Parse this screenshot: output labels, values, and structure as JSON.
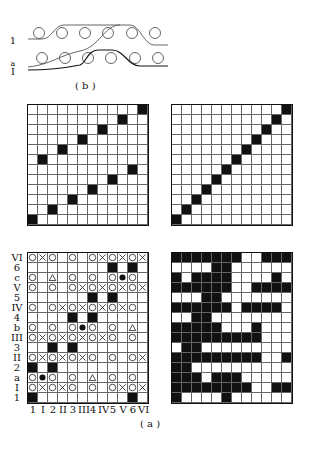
{
  "figure_b": {
    "caption": "( b )",
    "labels": [
      "1",
      "a",
      "I"
    ]
  },
  "figure_a": {
    "caption": "( a )"
  },
  "grid_top_left": {
    "rows": 12,
    "cols": 12,
    "black": [
      [
        0,
        11
      ],
      [
        1,
        9
      ],
      [
        2,
        7
      ],
      [
        3,
        5
      ],
      [
        4,
        3
      ],
      [
        5,
        1
      ],
      [
        6,
        10
      ],
      [
        7,
        8
      ],
      [
        8,
        6
      ],
      [
        9,
        4
      ],
      [
        10,
        2
      ],
      [
        11,
        0
      ]
    ]
  },
  "grid_top_right": {
    "rows": 12,
    "cols": 12,
    "black": [
      [
        0,
        11
      ],
      [
        1,
        10
      ],
      [
        2,
        9
      ],
      [
        3,
        8
      ],
      [
        4,
        7
      ],
      [
        5,
        6
      ],
      [
        6,
        5
      ],
      [
        7,
        4
      ],
      [
        8,
        3
      ],
      [
        9,
        2
      ],
      [
        10,
        1
      ],
      [
        11,
        0
      ]
    ]
  },
  "grid_bottom_left": {
    "row_labels": [
      "VI",
      "6",
      "c",
      "V",
      "5",
      "IV",
      "4",
      "b",
      "III",
      "3",
      "II",
      "2",
      "a",
      "I",
      "1"
    ],
    "col_labels": [
      "1",
      "I",
      "2",
      "II",
      "3",
      "III",
      "4",
      "IV",
      "5",
      "V",
      "6",
      "VI"
    ],
    "rows": [
      "OXO.O.OXOXOX",
      "........B.B.",
      "O.T.O.O.ODO.",
      "O.O.OXOXOXOX",
      "......B.B...",
      "O.OXOXOXOXO.",
      "....B.B.....",
      "O.O.ODO.O.T.",
      "OXOXOXOXO.O.",
      "..B.B.......",
      "OXOXOXO.O.OX",
      "B.B.........",
      "ODO.O.T.O.O.",
      "OXOXO.O.OXOX",
      "B.........B."
    ],
    "legend": {
      "O": "circle",
      "X": "cross",
      "T": "triangle",
      "D": "dot",
      "B": "black"
    }
  },
  "grid_bottom_right": {
    "rows": [
      "BBBBBBBWWBBB",
      "WWWWBBWWWWWW",
      "BWBBBBWWWWBW",
      "BBBBBBWWBBBB",
      "WWWBBWWWWWWW",
      "BBBBBBWBBBBW",
      "WWBBWWWWWWWW",
      "BBBBBWWWBWWW",
      "BBBBBBBBBWWW",
      "WBBWWWWWWWWW",
      "BBBBBBBBBWWB",
      "BBWWWWWWWWWW",
      "BBBWBBBWWWWW",
      "BBBBBBBBWWBB",
      "BWWWWBWWWWWW"
    ]
  }
}
